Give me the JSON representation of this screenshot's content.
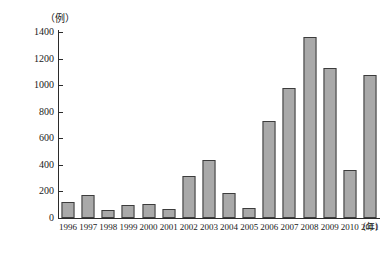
{
  "chart_data": {
    "type": "bar",
    "title": "",
    "xlabel": "（年）",
    "ylabel": "（例）",
    "categories": [
      "1996",
      "1997",
      "1998",
      "1999",
      "2000",
      "2001",
      "2002",
      "2003",
      "2004",
      "2005",
      "2006",
      "2007",
      "2008",
      "2009",
      "2010",
      "2011"
    ],
    "values": [
      120,
      175,
      60,
      95,
      105,
      70,
      315,
      435,
      185,
      75,
      730,
      980,
      1360,
      1130,
      365,
      1075
    ],
    "ylim": [
      0,
      1400
    ],
    "ytick_labels": [
      "0",
      "200",
      "400",
      "600",
      "800",
      "1000",
      "1200",
      "1400"
    ],
    "ytick_values": [
      0,
      200,
      400,
      600,
      800,
      1000,
      1200,
      1400
    ],
    "grid": false,
    "legend": null,
    "bar_color": "#a9a9a9",
    "bar_border_color": "#3c3c3c",
    "axis_color": "#2b2b2b"
  }
}
